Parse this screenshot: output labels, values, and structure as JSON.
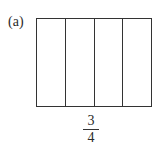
{
  "figure": {
    "label": "(a)",
    "parts_total": 4,
    "fraction": {
      "numerator": "3",
      "denominator": "4"
    }
  }
}
